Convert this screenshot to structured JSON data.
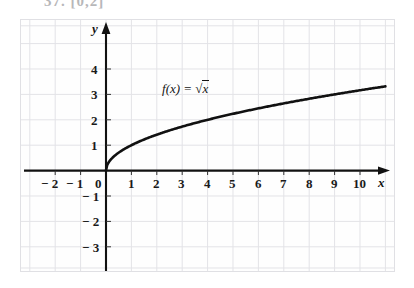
{
  "header": {
    "text": "37. [0,2]"
  },
  "figure": {
    "background": "#fefefe",
    "grid_color": "#e2e2e6",
    "axis_color": "#111111",
    "curve_color": "#111111"
  },
  "axes": {
    "x_axis_label": "x",
    "y_axis_label": "y",
    "x_ticks": [
      {
        "value": -2,
        "label": "− 2"
      },
      {
        "value": -1,
        "label": "− 1"
      },
      {
        "value": 0,
        "label": "0"
      },
      {
        "value": 1,
        "label": "1"
      },
      {
        "value": 2,
        "label": "2"
      },
      {
        "value": 3,
        "label": "3"
      },
      {
        "value": 4,
        "label": "4"
      },
      {
        "value": 5,
        "label": "5"
      },
      {
        "value": 6,
        "label": "6"
      },
      {
        "value": 7,
        "label": "7"
      },
      {
        "value": 8,
        "label": "8"
      },
      {
        "value": 9,
        "label": "9"
      },
      {
        "value": 10,
        "label": "10"
      }
    ],
    "y_ticks": [
      {
        "value": 4,
        "label": "4"
      },
      {
        "value": 3,
        "label": "3"
      },
      {
        "value": 2,
        "label": "2"
      },
      {
        "value": 1,
        "label": "1"
      },
      {
        "value": -1,
        "label": "− 1"
      },
      {
        "value": -2,
        "label": "− 2"
      },
      {
        "value": -3,
        "label": "− 3"
      }
    ]
  },
  "annotation": {
    "function_label_prefix": "f",
    "function_label_arg": "(x) = ",
    "function_label_radical": "√",
    "function_label_radicand": "x"
  },
  "chart_data": {
    "type": "line",
    "title": "",
    "subtitle": "",
    "xlabel": "x",
    "ylabel": "y",
    "xlim": [
      -3.4,
      11.0
    ],
    "ylim": [
      -4.1,
      4.6
    ],
    "grid": true,
    "grid_step_x": 1,
    "grid_step_y": 1,
    "legend": "none",
    "annotations": [
      {
        "text": "f(x) = √x",
        "x": 2.6,
        "y": 2.55
      }
    ],
    "series": [
      {
        "name": "f(x) = sqrt(x)",
        "equation": "y = sqrt(x)",
        "domain": [
          0,
          11.0
        ],
        "x": [
          0,
          0.1,
          0.25,
          0.5,
          0.75,
          1,
          1.5,
          2,
          2.5,
          3,
          4,
          5,
          6,
          7,
          8,
          9,
          10,
          11
        ],
        "y": [
          0,
          0.316,
          0.5,
          0.707,
          0.866,
          1,
          1.225,
          1.414,
          1.581,
          1.732,
          2,
          2.236,
          2.449,
          2.646,
          2.828,
          3,
          3.162,
          3.317
        ]
      }
    ]
  }
}
